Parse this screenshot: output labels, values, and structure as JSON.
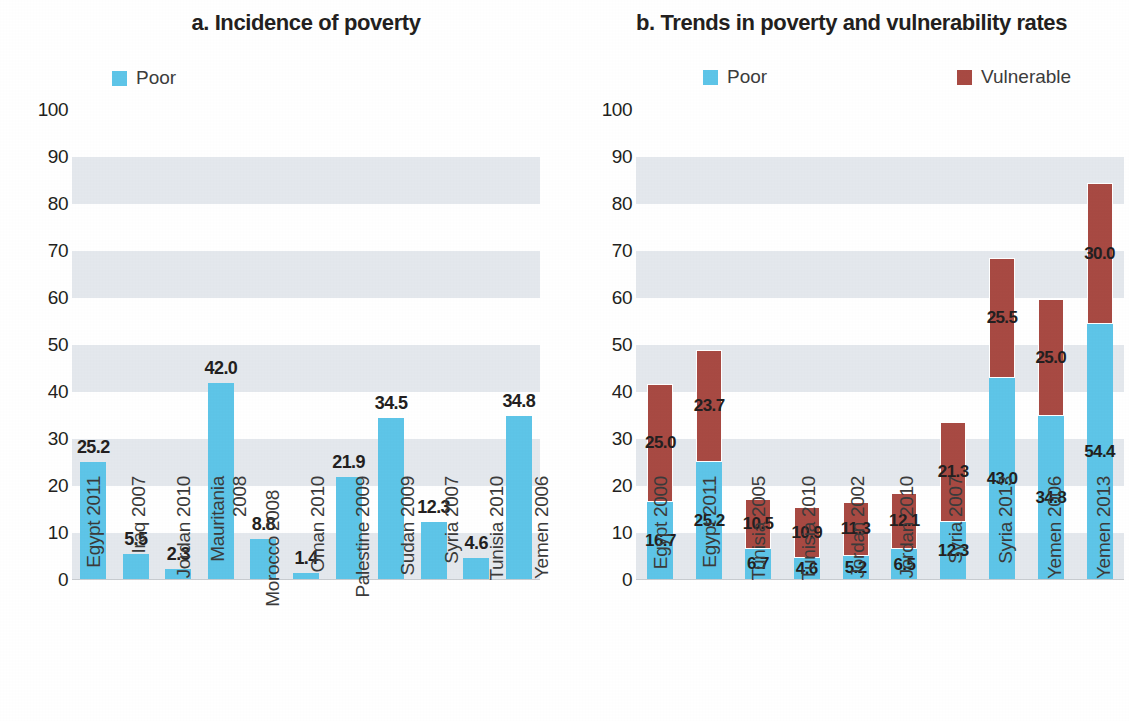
{
  "chart_data": [
    {
      "type": "bar",
      "title": "a. Incidence of poverty",
      "xlabel": "",
      "ylabel": "",
      "ylim": [
        0,
        100
      ],
      "ytick_labels": [
        "0",
        "10",
        "20",
        "30",
        "40",
        "50",
        "60",
        "70",
        "80",
        "90",
        "100"
      ],
      "grid": "alternating horizontal bands",
      "legend": [
        "Poor"
      ],
      "legend_position": "top-left",
      "categories": [
        "Egypt 2011",
        "Iraq 2007",
        "Jordan 2010",
        "Mauritania 2008",
        "Morocco 2008",
        "Oman 2010",
        "Palestine 2009",
        "Sudan 2009",
        "Syria 2007",
        "Tunisia 2010",
        "Yemen 2006"
      ],
      "series": [
        {
          "name": "Poor",
          "color": "#5ec5e8",
          "values": [
            25.2,
            5.5,
            2.3,
            42.0,
            8.8,
            1.4,
            21.9,
            34.5,
            12.3,
            4.6,
            34.8
          ]
        }
      ],
      "data_labels": [
        "25.2",
        "5.5",
        "2.3",
        "42.0",
        "8.8",
        "1.4",
        "21.9",
        "34.5",
        "12.3",
        "4.6",
        "34.8"
      ]
    },
    {
      "type": "bar",
      "subtype": "stacked",
      "title": "b. Trends in poverty and vulnerability rates",
      "xlabel": "",
      "ylabel": "",
      "ylim": [
        0,
        100
      ],
      "ytick_labels": [
        "0",
        "10",
        "20",
        "30",
        "40",
        "50",
        "60",
        "70",
        "80",
        "90",
        "100"
      ],
      "grid": "alternating horizontal bands",
      "legend": [
        "Poor",
        "Vulnerable"
      ],
      "legend_position": "top",
      "categories": [
        "Egypt 2000",
        "Egypt 2011",
        "Tunisia 2005",
        "Tunisia 2010",
        "Jordan 2002",
        "Jordan 2010",
        "Syria 2007",
        "Syria 2013",
        "Yemen 2006",
        "Yemen 2013"
      ],
      "series": [
        {
          "name": "Poor",
          "color": "#5ec5e8",
          "values": [
            16.7,
            25.2,
            6.7,
            4.6,
            5.2,
            6.5,
            12.3,
            43.0,
            34.8,
            54.4
          ]
        },
        {
          "name": "Vulnerable",
          "color": "#a84a43",
          "values": [
            25.0,
            23.7,
            10.5,
            10.9,
            11.3,
            12.1,
            21.3,
            25.5,
            25.0,
            30.0
          ]
        }
      ],
      "poor_labels": [
        "16.7",
        "25.2",
        "6.7",
        "4.6",
        "5.2",
        "6.5",
        "12.3",
        "43.0",
        "34.8",
        "54.4"
      ],
      "vulnerable_labels": [
        "25.0",
        "23.7",
        "10.5",
        "10.9",
        "11.3",
        "12.1",
        "21.3",
        "25.5",
        "25.0",
        "30.0"
      ]
    }
  ],
  "panel_a": {
    "title": "a. Incidence of poverty",
    "legend": {
      "poor": "Poor"
    },
    "yticks": [
      "100",
      "90",
      "80",
      "70",
      "60",
      "50",
      "40",
      "30",
      "20",
      "10",
      "0"
    ]
  },
  "panel_b": {
    "title": "b. Trends in poverty and vulnerability rates",
    "legend": {
      "poor": "Poor",
      "vulnerable": "Vulnerable"
    },
    "yticks": [
      "100",
      "90",
      "80",
      "70",
      "60",
      "50",
      "40",
      "30",
      "20",
      "10",
      "0"
    ]
  },
  "colors": {
    "poor": "#5ec5e8",
    "vulnerable": "#a84a43",
    "band": "#dfe4ea",
    "text": "#231f20"
  }
}
